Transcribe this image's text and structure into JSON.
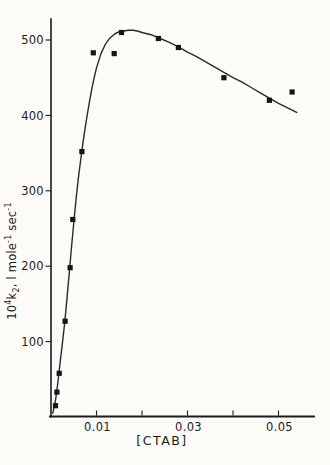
{
  "figure": {
    "background": "#fcfbf8",
    "ink": "#1c1c1c",
    "marker_color": "#151515",
    "curve_color": "#2a2a2a"
  },
  "chart_data": {
    "type": "scatter",
    "title": "",
    "xlabel": "[CTAB]",
    "ylabel": "10^4 k2, l mole^-1 sec^-1",
    "ylabel_rich": {
      "p1": "10",
      "e1": "4",
      "p2": "k",
      "s1": "2",
      "p3": ", l mole",
      "e2": "-1",
      "p4": " sec",
      "e3": "-1"
    },
    "xlim": [
      0,
      0.058
    ],
    "ylim": [
      0,
      529
    ],
    "grid": false,
    "legend_position": "none",
    "x_ticks": [
      0.01,
      0.02,
      0.03,
      0.04,
      0.05
    ],
    "x_tick_labels": [
      "0.01",
      "",
      "0.03",
      "",
      "0.05"
    ],
    "y_ticks": [
      100,
      200,
      300,
      400,
      500
    ],
    "y_tick_labels": [
      "100",
      "200",
      "300",
      "400",
      "500"
    ],
    "series": [
      {
        "name": "rate-constant-measurements",
        "marker": "filled-square",
        "points": [
          [
            0.001,
            15
          ],
          [
            0.0013,
            33
          ],
          [
            0.0018,
            58
          ],
          [
            0.0031,
            127
          ],
          [
            0.0042,
            198
          ],
          [
            0.0048,
            262
          ],
          [
            0.0068,
            352
          ],
          [
            0.0093,
            483
          ],
          [
            0.0139,
            482
          ],
          [
            0.0155,
            510
          ],
          [
            0.0236,
            502
          ],
          [
            0.028,
            490
          ],
          [
            0.038,
            450
          ],
          [
            0.048,
            420
          ],
          [
            0.053,
            431
          ]
        ]
      }
    ],
    "fit_curve": {
      "name": "fitted-curve",
      "points": [
        [
          0.0004,
          5
        ],
        [
          0.001,
          22
        ],
        [
          0.0015,
          45
        ],
        [
          0.002,
          72
        ],
        [
          0.0025,
          98
        ],
        [
          0.003,
          125
        ],
        [
          0.0035,
          156
        ],
        [
          0.004,
          190
        ],
        [
          0.0045,
          225
        ],
        [
          0.005,
          258
        ],
        [
          0.0055,
          288
        ],
        [
          0.006,
          316
        ],
        [
          0.0065,
          340
        ],
        [
          0.007,
          362
        ],
        [
          0.0075,
          383
        ],
        [
          0.008,
          402
        ],
        [
          0.0085,
          420
        ],
        [
          0.009,
          436
        ],
        [
          0.0095,
          450
        ],
        [
          0.01,
          463
        ],
        [
          0.011,
          482
        ],
        [
          0.012,
          495
        ],
        [
          0.013,
          503
        ],
        [
          0.014,
          508
        ],
        [
          0.015,
          511
        ],
        [
          0.016,
          512
        ],
        [
          0.017,
          513
        ],
        [
          0.018,
          513
        ],
        [
          0.019,
          512
        ],
        [
          0.02,
          510
        ],
        [
          0.022,
          507
        ],
        [
          0.024,
          502
        ],
        [
          0.026,
          497
        ],
        [
          0.028,
          491
        ],
        [
          0.03,
          484
        ],
        [
          0.032,
          478
        ],
        [
          0.034,
          471
        ],
        [
          0.036,
          464
        ],
        [
          0.038,
          457
        ],
        [
          0.04,
          450
        ],
        [
          0.042,
          444
        ],
        [
          0.044,
          437
        ],
        [
          0.046,
          430
        ],
        [
          0.048,
          423
        ],
        [
          0.05,
          416
        ],
        [
          0.052,
          410
        ],
        [
          0.054,
          404
        ]
      ]
    }
  }
}
